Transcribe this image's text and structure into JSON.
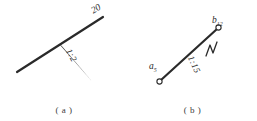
{
  "sheet": {
    "background_color": "#ffffff",
    "ink_color": "#2a2a2a",
    "width": 257,
    "height": 121
  },
  "figures": [
    {
      "key": "a",
      "caption": "( a )",
      "annotations": {
        "length_label": "20",
        "slope_label": "1:2"
      },
      "elements": {
        "main_line_name": "main-line",
        "slope_line_name": "slope-line"
      }
    },
    {
      "key": "b",
      "caption": "( b )",
      "annotations": {
        "start_point_label": "a",
        "start_point_subscript": "5",
        "end_point_label": "b",
        "end_point_subscript": "12",
        "slope_label": "1:15"
      },
      "elements": {
        "main_line_name": "segment-line",
        "slope_tick_name": "slope-tick-mark"
      }
    }
  ]
}
